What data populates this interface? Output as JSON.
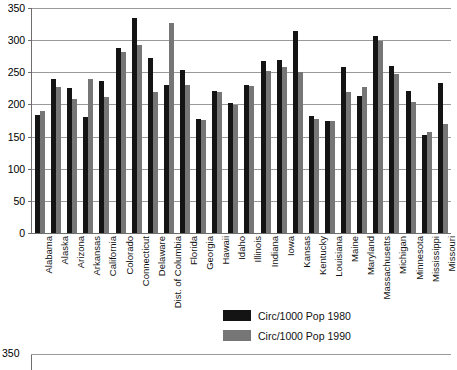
{
  "chart_data": {
    "type": "bar",
    "title": "",
    "xlabel": "",
    "ylabel": "",
    "ylim": [
      0,
      350
    ],
    "y_ticks": [
      0,
      50,
      100,
      150,
      200,
      250,
      300,
      350
    ],
    "grid": true,
    "legend_position": "bottom-center",
    "categories": [
      "Alabama",
      "Alaska",
      "Arizona",
      "Arkansas",
      "California",
      "Colorado",
      "Connecticut",
      "Delaware",
      "Dist. of Columbia",
      "Florida",
      "Georgia",
      "Hawaii",
      "Idaho",
      "Illinois",
      "Indiana",
      "Iowa",
      "Kansas",
      "Kentucky",
      "Louisiana",
      "Maine",
      "Maryland",
      "Massachusetts",
      "Michigan",
      "Minnesota",
      "Mississippi",
      "Missouri"
    ],
    "series": [
      {
        "name": "Circ/1000 Pop 1980",
        "color": "#141414",
        "values": [
          184,
          239,
          225,
          180,
          236,
          288,
          335,
          273,
          231,
          253,
          177,
          221,
          202,
          231,
          268,
          269,
          315,
          182,
          174,
          259,
          213,
          307,
          260,
          221,
          152,
          234
        ]
      },
      {
        "name": "Circ/1000 Pop 1990",
        "color": "#767676",
        "values": [
          190,
          227,
          208,
          240,
          212,
          282,
          292,
          219,
          327,
          231,
          176,
          220,
          199,
          229,
          252,
          258,
          251,
          178,
          175,
          219,
          227,
          299,
          248,
          204,
          157,
          170
        ]
      }
    ]
  },
  "legend": {
    "items": [
      {
        "label": "Circ/1000 Pop 1980",
        "color": "#141414"
      },
      {
        "label": "Circ/1000 Pop 1990",
        "color": "#767676"
      }
    ]
  },
  "next_chart_peek": {
    "top_tick": "350"
  }
}
